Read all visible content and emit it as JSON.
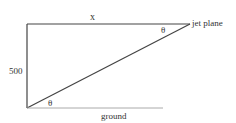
{
  "diagram": {
    "labels": {
      "top_side": "x",
      "plane": "jet plane",
      "height": "500",
      "angle_top": "θ",
      "angle_bottom": "θ",
      "ground": "ground"
    },
    "colors": {
      "line": "#333333",
      "ground_line": "#aaaaaa",
      "text": "#333333"
    }
  }
}
